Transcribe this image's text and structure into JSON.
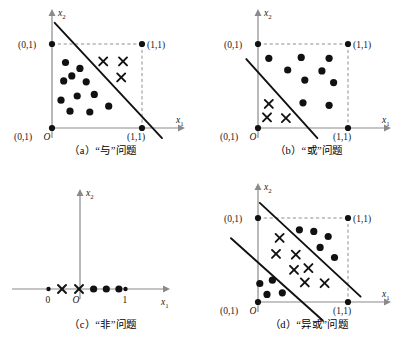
{
  "figure": {
    "background": "#ffffff",
    "ink_color": "#111111",
    "axis_color": "#8a8a8a",
    "guide_color": "#8f8f8f"
  },
  "axis_labels": {
    "x_base": "x",
    "x_sub": "1",
    "y_base": "x",
    "y_sub": "2",
    "origin": "O"
  },
  "panels": [
    {
      "id": "a",
      "caption": "（a）“与”问题",
      "corner_labels": {
        "top_left": "(0,1)",
        "top_right": "(1,1)",
        "bottom_left": "(0,1)",
        "bottom_right": "(1,1)"
      },
      "dots": [
        [
          0.15,
          0.78
        ],
        [
          0.31,
          0.71
        ],
        [
          0.13,
          0.56
        ],
        [
          0.38,
          0.55
        ],
        [
          0.22,
          0.62
        ],
        [
          0.28,
          0.38
        ],
        [
          0.47,
          0.4
        ],
        [
          0.1,
          0.33
        ],
        [
          0.2,
          0.2
        ],
        [
          0.42,
          0.19
        ],
        [
          0.63,
          0.26
        ]
      ],
      "crosses": [
        [
          0.58,
          0.79
        ],
        [
          0.8,
          0.79
        ],
        [
          0.78,
          0.6
        ]
      ],
      "boundaries": [
        {
          "x1": 0.03,
          "y1": 1.18,
          "x2": 1.22,
          "y2": -0.12
        }
      ]
    },
    {
      "id": "b",
      "caption": "（b）“或”问题",
      "corner_labels": {
        "top_left": "(0,1)",
        "top_right": "(1,1)",
        "bottom_left": "(0,1)",
        "bottom_right": "(1,1)"
      },
      "dots": [
        [
          0.12,
          0.83
        ],
        [
          0.48,
          0.84
        ],
        [
          0.79,
          0.83
        ],
        [
          0.33,
          0.69
        ],
        [
          0.71,
          0.68
        ],
        [
          0.52,
          0.57
        ],
        [
          0.84,
          0.54
        ],
        [
          0.5,
          0.3
        ],
        [
          0.79,
          0.27
        ]
      ],
      "crosses": [
        [
          0.12,
          0.28
        ],
        [
          0.1,
          0.12
        ],
        [
          0.31,
          0.11
        ]
      ],
      "boundaries": [
        {
          "x1": -0.13,
          "y1": 0.82,
          "x2": 0.66,
          "y2": -0.12
        }
      ]
    },
    {
      "id": "c",
      "caption": "（c）“非”问题",
      "tick_labels": {
        "left": "0",
        "right": "1"
      },
      "small_dots": [
        -0.4,
        1.06
      ],
      "crosses_1d": [
        -0.24,
        -0.04
      ],
      "dots_1d": [
        0.2,
        0.42,
        0.64
      ],
      "boundaries": []
    },
    {
      "id": "d",
      "caption": "（d）“异或”问题",
      "corner_labels": {
        "top_left": "(0,1)",
        "top_right": "(1,1)",
        "bottom_left": "(0,1)",
        "bottom_right": "(1,1)"
      },
      "dots": [
        [
          0.46,
          0.86
        ],
        [
          0.62,
          0.84
        ],
        [
          0.78,
          0.78
        ],
        [
          0.69,
          0.65
        ],
        [
          0.85,
          0.53
        ],
        [
          0.02,
          0.22
        ],
        [
          0.16,
          0.26
        ],
        [
          0.1,
          0.09
        ],
        [
          0.27,
          0.11
        ]
      ],
      "crosses": [
        [
          0.24,
          0.74
        ],
        [
          0.2,
          0.55
        ],
        [
          0.42,
          0.54
        ],
        [
          0.4,
          0.36
        ],
        [
          0.56,
          0.38
        ],
        [
          0.52,
          0.21
        ],
        [
          0.74,
          0.2
        ]
      ],
      "boundaries": [
        {
          "x1": 0.02,
          "y1": 1.18,
          "x2": 1.14,
          "y2": 0.06
        },
        {
          "x1": -0.3,
          "y1": 0.76,
          "x2": 0.72,
          "y2": -0.22
        }
      ]
    }
  ]
}
